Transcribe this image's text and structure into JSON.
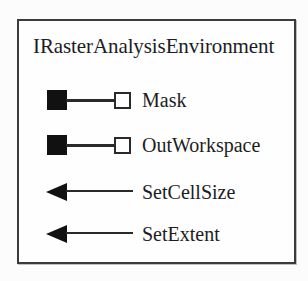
{
  "diagram": {
    "type": "uml-interface",
    "title": "IRasterAnalysisEnvironment",
    "members": [
      {
        "name": "Mask",
        "kind": "property",
        "icon": "property-readwrite-icon"
      },
      {
        "name": "OutWorkspace",
        "kind": "property",
        "icon": "property-readwrite-icon"
      },
      {
        "name": "SetCellSize",
        "kind": "method",
        "icon": "method-arrow-icon"
      },
      {
        "name": "SetExtent",
        "kind": "method",
        "icon": "method-arrow-icon"
      }
    ]
  },
  "colors": {
    "border": "#3b3b3b",
    "filled_square": "#111111",
    "hollow_square_stroke": "#2a2a2a",
    "hollow_square_fill": "#ffffff",
    "arrow": "#111111",
    "text": "#1d1d1d",
    "background": "#fcfcfc"
  }
}
